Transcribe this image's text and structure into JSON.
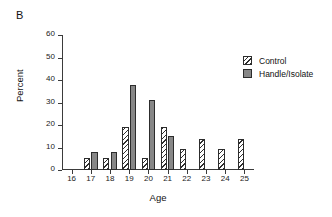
{
  "panel": {
    "label": "B"
  },
  "chart_data": {
    "type": "bar",
    "title": "",
    "xlabel": "Age",
    "ylabel": "Percent",
    "categories": [
      "16",
      "17",
      "18",
      "19",
      "20",
      "21",
      "22",
      "23",
      "24",
      "25"
    ],
    "series": [
      {
        "name": "Control",
        "values": [
          0,
          5.2,
          5.2,
          19.0,
          5.2,
          19.0,
          9.5,
          14.0,
          9.5,
          14.0
        ],
        "fill": "hatched-diagonal",
        "color": "#ffffff",
        "edge_color": "#2c2c2c"
      },
      {
        "name": "Handle/Isolate",
        "values": [
          0,
          8.0,
          8.0,
          38.0,
          31.0,
          15.0,
          0,
          0,
          0,
          0
        ],
        "fill": "solid",
        "color": "#878787",
        "edge_color": "#2c2c2c"
      }
    ],
    "ylim": [
      0,
      60
    ],
    "yticks": [
      0,
      10,
      20,
      30,
      40,
      50,
      60
    ],
    "ytick_labels": [
      "0",
      "10",
      "20",
      "30",
      "40",
      "50",
      "60"
    ],
    "xtick_labels": [
      "16",
      "17",
      "18",
      "19",
      "20",
      "21",
      "22",
      "23",
      "24",
      "25"
    ],
    "grid": false,
    "legend_position": "upper right",
    "legend_entries": [
      "Control",
      "Handle/Isolate"
    ]
  },
  "legend": {
    "items": [
      {
        "label": "Control",
        "swatch": "hatched-swatch"
      },
      {
        "label": "Handle/Isolate",
        "swatch": "solid-gray-swatch"
      }
    ]
  },
  "colors": {
    "control_fill": "#ffffff",
    "handle_fill": "#878787",
    "axis": "#3b3b3b",
    "text": "#111111"
  }
}
